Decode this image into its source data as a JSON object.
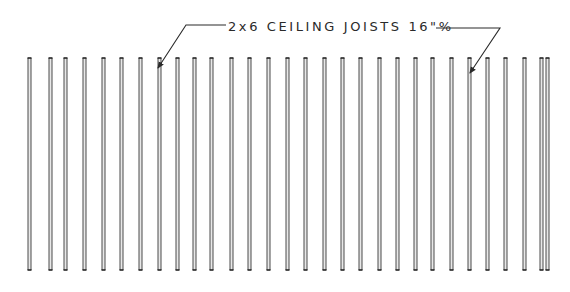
{
  "diagram": {
    "type": "framing-plan",
    "label": {
      "text": "2x6 CEILING JOISTS 16\"o/c",
      "display_text": "2x6 CEILING JOISTS 16\"%",
      "x": 228,
      "y": 31
    },
    "leaders": [
      {
        "name": "left-leader",
        "points": [
          [
            226,
            25
          ],
          [
            186,
            25
          ],
          [
            158,
            68
          ]
        ]
      },
      {
        "name": "right-leader",
        "points": [
          [
            436,
            28
          ],
          [
            500,
            28
          ],
          [
            470,
            73
          ]
        ]
      }
    ],
    "joists": {
      "top_y": 58,
      "bottom_y": 270,
      "line_gap": 3,
      "stroke_color": "#4a4a4a",
      "x_positions": [
        28,
        49,
        64,
        83,
        102,
        120,
        139,
        158,
        176,
        193,
        210,
        230,
        248,
        267,
        286,
        304,
        323,
        341,
        359,
        378,
        396,
        414,
        431,
        450,
        468,
        486,
        504,
        523,
        540,
        546
      ]
    },
    "colors": {
      "background": "#ffffff",
      "ink": "#2a2a2a"
    }
  }
}
